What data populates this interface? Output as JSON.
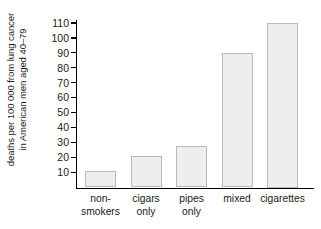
{
  "chart_data": {
    "type": "bar",
    "title": "",
    "xlabel": "",
    "ylabel_line1": "deaths per 100 000 from lung cancer",
    "ylabel_line2": "in American men aged 40–79",
    "categories": [
      "non-\nsmokers",
      "cigars\nonly",
      "pipes\nonly",
      "mixed",
      "cigarettes"
    ],
    "values": [
      11,
      21,
      28,
      90,
      110
    ],
    "ylim": [
      0,
      115
    ],
    "yticks": [
      10,
      20,
      30,
      40,
      50,
      60,
      70,
      80,
      90,
      100,
      110
    ],
    "ytick_labels": [
      "10",
      "20",
      "30",
      "40",
      "50",
      "60",
      "70",
      "80",
      "90",
      "100",
      "110"
    ],
    "grid": false,
    "legend": null,
    "bar_fill_color": "#eeeeee",
    "bar_border_color": "#b9b9b9",
    "axis_color": "#000000",
    "background_color": "#ffffff"
  }
}
